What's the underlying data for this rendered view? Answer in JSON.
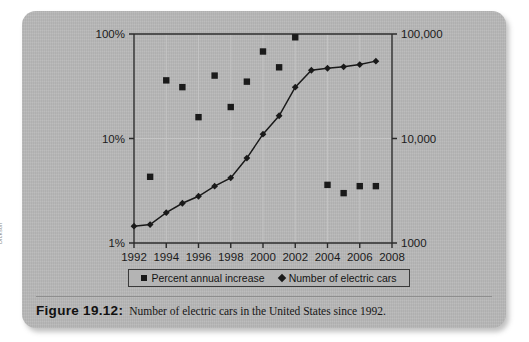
{
  "figure": {
    "caption_number": "Figure 19.12:",
    "caption_text": "Number of electric cars in the United States since 1992.",
    "credit": "Dickson"
  },
  "legend": {
    "items": [
      {
        "marker": "square-marker",
        "label": "Percent annual increase"
      },
      {
        "marker": "diamond-marker",
        "label": "Number of electric cars"
      }
    ]
  },
  "axes": {
    "left_ticks": [
      "100%",
      "10%",
      "1%"
    ],
    "right_ticks": [
      "100,000",
      "10,000",
      "1000"
    ],
    "x_ticks": [
      "1992",
      "1994",
      "1996",
      "1998",
      "2000",
      "2002",
      "2004",
      "2006",
      "2008"
    ]
  },
  "colors": {
    "panel": "#b6b6b6",
    "ink": "#1a1a1a",
    "axis": "#2b2b2b",
    "gridline": "#c6c6c6"
  },
  "chart_data": {
    "type": "scatter",
    "title": "Number of electric cars in the United States since 1992",
    "xlabel": "",
    "ylabel_left": "Percent annual increase",
    "ylabel_right": "Number of electric cars",
    "xlim": [
      1992,
      2008
    ],
    "ylim_left": [
      1,
      100
    ],
    "ylim_right": [
      1000,
      100000
    ],
    "yscale": "log",
    "grid": true,
    "legend_position": "bottom",
    "x": [
      1992,
      1993,
      1994,
      1995,
      1996,
      1997,
      1998,
      1999,
      2000,
      2001,
      2002,
      2003,
      2004,
      2005,
      2006,
      2007
    ],
    "series": [
      {
        "name": "Number of electric cars",
        "marker": "diamond",
        "line": true,
        "axis": "right",
        "values": [
          1450,
          1500,
          1950,
          2400,
          2800,
          3500,
          4200,
          6500,
          11000,
          16500,
          31000,
          45000,
          47000,
          48500,
          51000,
          55000
        ]
      },
      {
        "name": "Percent annual increase",
        "marker": "square",
        "line": false,
        "axis": "left",
        "x": [
          1993,
          1994,
          1995,
          1996,
          1997,
          1998,
          1999,
          2000,
          2001,
          2002,
          2004,
          2005,
          2006,
          2007
        ],
        "values": [
          4.3,
          36,
          31,
          16,
          40,
          20,
          35,
          68,
          48,
          93,
          3.6,
          3.0,
          3.5,
          3.5
        ]
      }
    ]
  }
}
